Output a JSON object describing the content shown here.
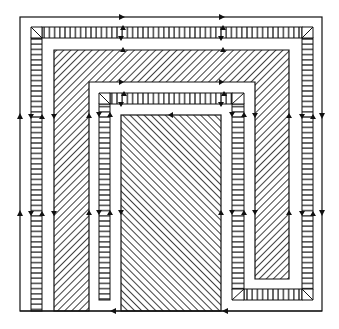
{
  "diagram": {
    "title": "",
    "colors": {
      "background": "#ffffff",
      "stroke": "#111111",
      "gap_fill": "#f4f4f4"
    },
    "outer_boundary": {
      "x": 20,
      "y": 17,
      "w": 302,
      "h": 294
    },
    "outer_band": {
      "x": 31,
      "y": 27,
      "w": 282,
      "thickness": 11,
      "bottom_y": 311,
      "pattern": "vertical-lines"
    },
    "outer_region": {
      "pattern": "forward-diagonal",
      "left": {
        "x": 54,
        "y": 50,
        "w": 35,
        "h": 261
      },
      "top": {
        "x": 54,
        "y": 50,
        "w": 235,
        "h": 32
      },
      "right": {
        "x": 255,
        "y": 50,
        "w": 34,
        "h": 229
      }
    },
    "inner_gap": {
      "x": 89,
      "y": 82,
      "w": 166,
      "h": 229
    },
    "inner_band": {
      "x": 99,
      "y": 93,
      "w": 145,
      "thickness": 11,
      "bottom_y": 300,
      "pattern": "vertical-lines"
    },
    "bottom_right_band": {
      "x": 232,
      "y": 289,
      "w": 81,
      "h": 11
    },
    "center_region": {
      "x": 121,
      "y": 115,
      "w": 100,
      "h": 196,
      "pattern": "back-diagonal"
    },
    "arrows": {
      "top_line_right": [
        {
          "x": 122,
          "y": 17
        },
        {
          "x": 222,
          "y": 17
        }
      ],
      "bottom_line_left": [
        {
          "x": 113,
          "y": 311
        },
        {
          "x": 225,
          "y": 311
        }
      ],
      "left_line_up": [
        {
          "x": 20,
          "y": 116
        },
        {
          "x": 20,
          "y": 213
        }
      ],
      "right_line_down": [
        {
          "x": 322,
          "y": 116
        },
        {
          "x": 322,
          "y": 213
        }
      ]
    }
  }
}
